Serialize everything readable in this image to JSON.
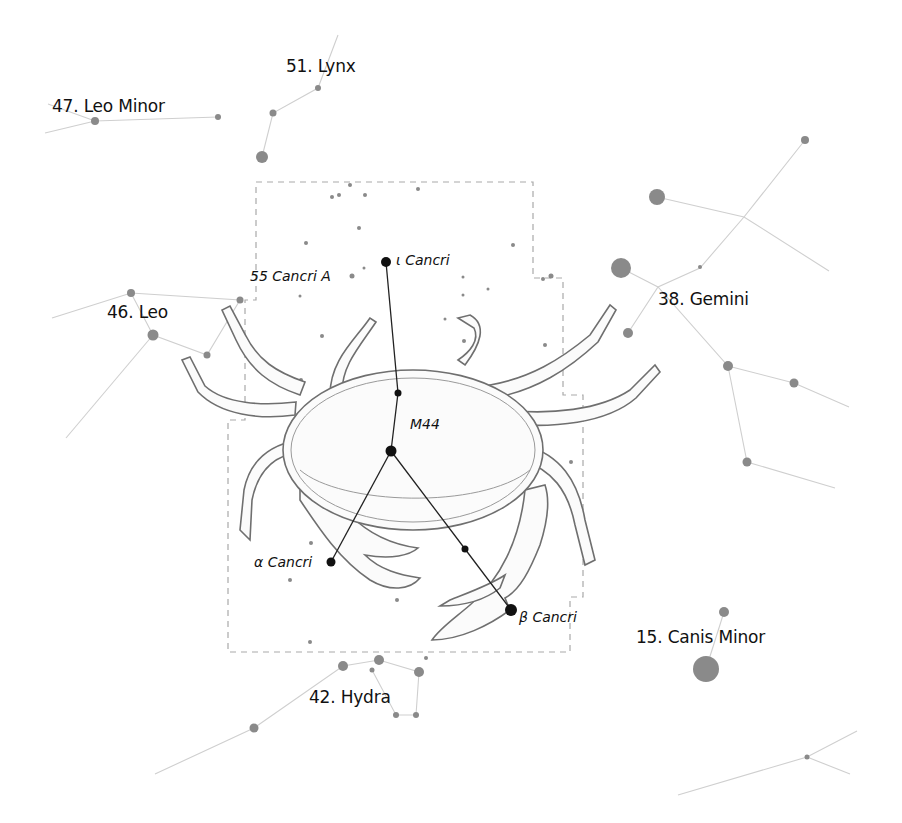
{
  "colors": {
    "background": "#ffffff",
    "main_asterism": "#222222",
    "neighbor_lines": "#cfcfcf",
    "neighbor_stars": "#8a8a8a",
    "boundary": "#a9a9a9",
    "crab_outline": "#6f6f6f"
  },
  "neighbors": [
    {
      "id": "leo-minor",
      "label": "47. Leo Minor"
    },
    {
      "id": "lynx",
      "label": "51. Lynx"
    },
    {
      "id": "leo",
      "label": "46. Leo"
    },
    {
      "id": "gemini",
      "label": "38. Gemini"
    },
    {
      "id": "canis-minor",
      "label": "15. Canis Minor"
    },
    {
      "id": "hydra",
      "label": "42. Hydra"
    }
  ],
  "stars": {
    "iota": "ι Cancri",
    "alpha": "α Cancri",
    "beta": "β Cancri",
    "cancri55": "55 Cancri A",
    "m44": "M44"
  }
}
